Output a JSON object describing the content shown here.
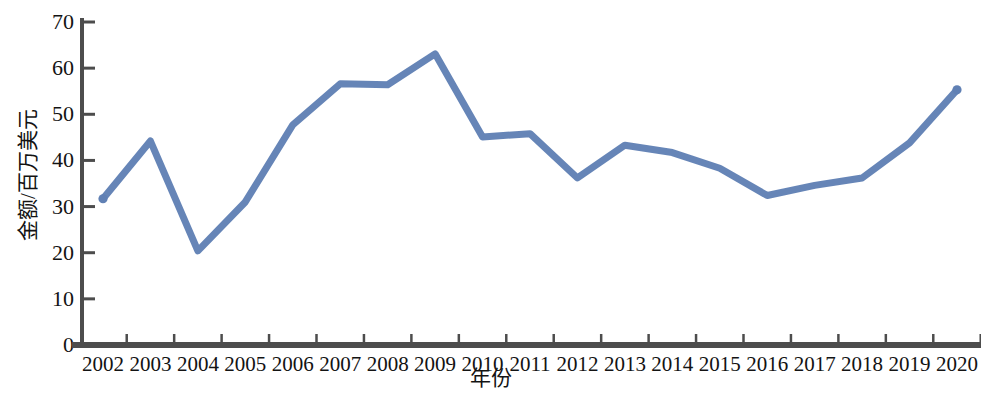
{
  "chart_data": {
    "type": "line",
    "title": "",
    "xlabel": "年份",
    "ylabel": "金额/百万美元",
    "categories": [
      "2002",
      "2003",
      "2004",
      "2005",
      "2006",
      "2007",
      "2008",
      "2009",
      "2010",
      "2011",
      "2012",
      "2013",
      "2014",
      "2015",
      "2016",
      "2017",
      "2018",
      "2019",
      "2020"
    ],
    "values": [
      31.7,
      44.2,
      20.4,
      31.0,
      47.7,
      56.6,
      56.4,
      63.1,
      45.1,
      45.8,
      36.2,
      43.3,
      41.7,
      38.3,
      32.4,
      34.6,
      36.2,
      43.8,
      55.3
    ],
    "series": [
      {
        "name": "金额",
        "values": [
          31.7,
          44.2,
          20.4,
          31.0,
          47.7,
          56.6,
          56.4,
          63.1,
          45.1,
          45.8,
          36.2,
          43.3,
          41.7,
          38.3,
          32.4,
          34.6,
          36.2,
          43.8,
          55.3
        ],
        "color": "#6080b4"
      }
    ],
    "ylim": [
      0,
      70
    ],
    "y_ticks": [
      0,
      10,
      20,
      30,
      40,
      50,
      60,
      70
    ],
    "y_tick_labels": [
      "0",
      "10",
      "20",
      "30",
      "40",
      "50",
      "60",
      "70"
    ],
    "grid": false,
    "legend": null,
    "legend_position": "none",
    "line_color": "#6080b4",
    "axis_color": "#4d4d4d"
  },
  "axes": {
    "y_title": "金额/百万美元",
    "x_title": "年份"
  }
}
